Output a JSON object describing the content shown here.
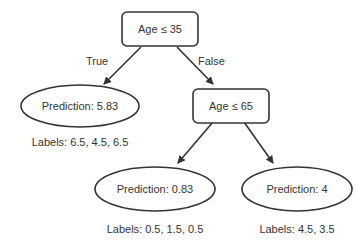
{
  "diagram": {
    "type": "decision-tree",
    "nodes": {
      "root": {
        "label": "Age ≤ 35",
        "shape": "rounded-rect"
      },
      "left_leaf": {
        "label": "Prediction: 5.83",
        "shape": "ellipse",
        "labels": "Labels: 6.5, 4.5, 6.5"
      },
      "split2": {
        "label": "Age ≤ 65",
        "shape": "rounded-rect"
      },
      "mid_leaf": {
        "label": "Prediction: 0.83",
        "shape": "ellipse",
        "labels": "Labels: 0.5, 1.5, 0.5"
      },
      "right_leaf": {
        "label": "Prediction: 4",
        "shape": "ellipse",
        "labels": "Labels: 4.5, 3.5"
      }
    },
    "edges": {
      "root_true": {
        "from": "root",
        "to": "left_leaf",
        "label": "True"
      },
      "root_false": {
        "from": "root",
        "to": "split2",
        "label": "False"
      },
      "split2_left": {
        "from": "split2",
        "to": "mid_leaf"
      },
      "split2_right": {
        "from": "split2",
        "to": "right_leaf"
      }
    }
  }
}
